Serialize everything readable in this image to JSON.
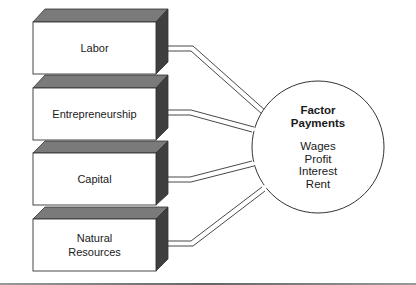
{
  "diagram": {
    "type": "factor-flow",
    "factors": [
      {
        "label": "Labor"
      },
      {
        "label": "Entrepreneurship"
      },
      {
        "label": "Capital"
      },
      {
        "label": "Natural\nResources"
      }
    ],
    "payments": {
      "title_line1": "Factor",
      "title_line2": "Payments",
      "items": [
        "Wages",
        "Profit",
        "Interest",
        "Rent"
      ]
    },
    "colors": {
      "box_front": "#ffffff",
      "box_top": "#7a7a7a",
      "box_side": "#3f3f3f",
      "outline": "#333333",
      "text": "#1a1a1a"
    }
  }
}
